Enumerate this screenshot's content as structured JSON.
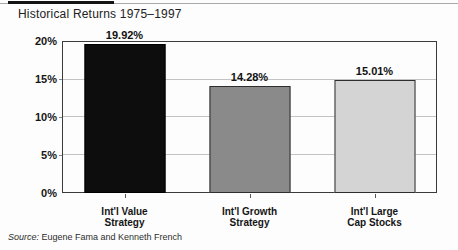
{
  "chart_data": {
    "type": "bar",
    "title": "Historical Returns 1975–1997",
    "categories": [
      "Int'l Value\nStrategy",
      "Int'l Growth\nStrategy",
      "Int'l Large\nCap Stocks"
    ],
    "values": [
      19.92,
      14.28,
      15.01
    ],
    "value_labels": [
      "19.92%",
      "14.28%",
      "15.01%"
    ],
    "bar_colors": [
      "#0d0d0d",
      "#8a8a8a",
      "#d4d4d4"
    ],
    "bar_border_colors": [
      "#000000",
      "#2e2e2e",
      "#2e2e2e"
    ],
    "xlabel": "",
    "ylabel": "",
    "ylim": [
      0,
      20
    ],
    "yticks": [
      0,
      5,
      10,
      15,
      20
    ],
    "ytick_labels": [
      "0%",
      "5%",
      "10%",
      "15%",
      "20%"
    ],
    "grid": true,
    "legend": "none"
  },
  "source": {
    "prefix": "Source:",
    "text": " Eugene Fama and Kenneth French"
  },
  "colors": {
    "accent_rule": "#141414",
    "thin_rule": "#a9a9a9",
    "frame_border": "#3b3b3b",
    "gridline": "#c3c3c3"
  }
}
